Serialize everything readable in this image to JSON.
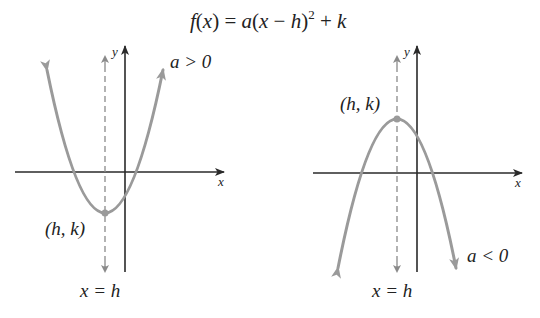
{
  "title": {
    "formula": "f(x) = a(x − h)² + k",
    "parts": {
      "f": "f",
      "lp": "(",
      "x": "x",
      "rp": ")",
      "eq": " = ",
      "a": "a",
      "lp2": "(",
      "x2": "x",
      "minus": " − ",
      "h": "h",
      "rp2": ")",
      "sup": "2",
      "plus": " + ",
      "k": "k"
    }
  },
  "left_graph": {
    "axis_x_label": "x",
    "axis_y_label": "y",
    "vertex_label": "(h, k)",
    "condition_label": "a > 0",
    "axis_of_symmetry_label": "x = h",
    "opens": "up"
  },
  "right_graph": {
    "axis_x_label": "x",
    "axis_y_label": "y",
    "vertex_label": "(h, k)",
    "condition_label": "a < 0",
    "axis_of_symmetry_label": "x = h",
    "opens": "down"
  },
  "colors": {
    "axis": "#2a2a2a",
    "curve": "#9a9a9a",
    "dash": "#8a8a8a",
    "text": "#222222"
  }
}
